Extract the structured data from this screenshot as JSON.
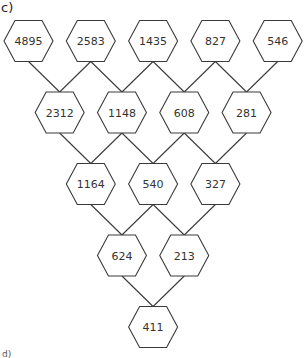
{
  "labels": {
    "part_c": "c)",
    "part_d": "d)"
  },
  "pyramid": {
    "rows": [
      [
        "4895",
        "2583",
        "1435",
        "827",
        "546"
      ],
      [
        "2312",
        "1148",
        "608",
        "281"
      ],
      [
        "1164",
        "540",
        "327"
      ],
      [
        "624",
        "213"
      ],
      [
        "411"
      ]
    ]
  },
  "colors": {
    "stroke": "#3a3a3a",
    "text": "#333333",
    "background": "#ffffff"
  }
}
